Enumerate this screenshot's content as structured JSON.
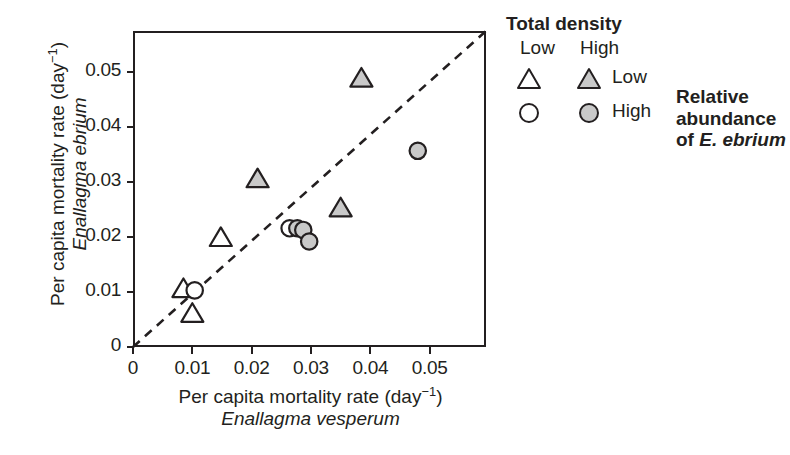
{
  "figure": {
    "background_color": "#ffffff",
    "axis_color": "#231f20",
    "symbol_fill_color": "#c9c9c9",
    "symbol_edge_color": "#231f20",
    "reference_line_color": "#231f20"
  },
  "axes": {
    "x": {
      "title_line1_prefix": "Per capita mortality rate (day",
      "title_line1_exponent": "−1",
      "title_line1_suffix": ")",
      "title_line2": "Enallagma vesperum",
      "ticks": [
        "0",
        "0.01",
        "0.02",
        "0.03",
        "0.04",
        "0.05"
      ],
      "min": 0,
      "max": 0.0595
    },
    "y": {
      "title_line1_prefix": "Per capita mortality rate (day",
      "title_line1_exponent": "−1",
      "title_line1_suffix": ")",
      "title_line2": "Enallagma ebrium",
      "ticks": [
        "0",
        "0.01",
        "0.02",
        "0.03",
        "0.04",
        "0.05"
      ],
      "min": 0,
      "max": 0.0575
    }
  },
  "legend": {
    "title": "Total density",
    "column_headers": [
      "Low",
      "High"
    ],
    "rows": [
      {
        "label": "Low",
        "shape": "triangle"
      },
      {
        "label": "High",
        "shape": "circle"
      }
    ],
    "side_note_line1": "Relative",
    "side_note_line2": "abundance",
    "side_note_line3_prefix": "of ",
    "side_note_line3_sci": "E. ebrium"
  },
  "chart_data": {
    "type": "scatter",
    "title": "",
    "xlabel": "Per capita mortality rate (day−1) Enallagma vesperum",
    "ylabel": "Per capita mortality rate (day−1) Enallagma ebrium",
    "xlim": [
      0,
      0.0595
    ],
    "ylim": [
      0,
      0.0575
    ],
    "grid": false,
    "legend_position": "right",
    "annotations": [
      {
        "type": "reference-line",
        "style": "dashed",
        "description": "1:1 line from origin to upper-right corner",
        "from": [
          0,
          0
        ],
        "to": [
          0.0595,
          0.0575
        ]
      }
    ],
    "series": [
      {
        "name": "Low total density, Low relative abundance",
        "marker": "triangle",
        "fill": "open",
        "points": [
          {
            "x": 0.0085,
            "y": 0.0105
          },
          {
            "x": 0.01,
            "y": 0.006
          },
          {
            "x": 0.0148,
            "y": 0.0198
          }
        ]
      },
      {
        "name": "High total density, Low relative abundance",
        "marker": "triangle",
        "fill": "filled",
        "points": [
          {
            "x": 0.021,
            "y": 0.0305
          },
          {
            "x": 0.035,
            "y": 0.0252
          },
          {
            "x": 0.0385,
            "y": 0.0488
          }
        ]
      },
      {
        "name": "Low total density, High relative abundance",
        "marker": "circle",
        "fill": "open",
        "points": [
          {
            "x": 0.0104,
            "y": 0.0103
          },
          {
            "x": 0.0264,
            "y": 0.0216
          }
        ]
      },
      {
        "name": "High total density, High relative abundance",
        "marker": "circle",
        "fill": "filled",
        "points": [
          {
            "x": 0.0277,
            "y": 0.0216
          },
          {
            "x": 0.0287,
            "y": 0.0213
          },
          {
            "x": 0.0297,
            "y": 0.0192
          },
          {
            "x": 0.048,
            "y": 0.0357
          }
        ]
      }
    ]
  }
}
